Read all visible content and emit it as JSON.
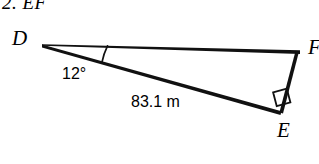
{
  "figure": {
    "heading": "2.  EF",
    "background_color": "#ffffff",
    "stroke_color": "#000000",
    "vertices": [
      {
        "name": "D",
        "label": "D",
        "x": 42,
        "y": 44
      },
      {
        "name": "F",
        "label": "F",
        "x": 300,
        "y": 52
      },
      {
        "name": "E",
        "label": "E",
        "x": 281,
        "y": 113
      }
    ],
    "segments": [
      {
        "name": "segment-df",
        "from": "D",
        "to": "F"
      },
      {
        "name": "segment-de",
        "from": "D",
        "to": "E"
      },
      {
        "name": "segment-fe",
        "from": "F",
        "to": "E"
      }
    ],
    "angle_mark": {
      "at": "D",
      "label": "12°",
      "value": 12,
      "unit": "degrees"
    },
    "right_angle_mark": {
      "at": "E",
      "size": 14
    },
    "side_measure": {
      "on": "segment-de",
      "label": "83.1 m",
      "value": 83.1,
      "unit": "m"
    }
  }
}
